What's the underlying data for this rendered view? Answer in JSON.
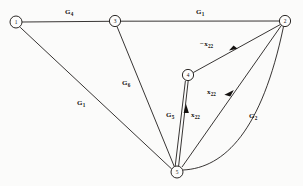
{
  "figure": {
    "kind": "signal-flow-graph",
    "background_color": "#fbfbfa",
    "line_color": "#14110f",
    "width": 303,
    "height": 186
  },
  "nodes": [
    {
      "id": "1",
      "label": "1",
      "x": 16,
      "y": 22,
      "r": 6.0
    },
    {
      "id": "3",
      "label": "3",
      "x": 115,
      "y": 21,
      "r": 5.6
    },
    {
      "id": "2",
      "label": "2",
      "x": 285,
      "y": 21,
      "r": 5.6
    },
    {
      "id": "4",
      "label": "4",
      "x": 188,
      "y": 75,
      "r": 5.6
    },
    {
      "id": "5",
      "label": "5",
      "x": 177,
      "y": 172,
      "r": 6.0
    }
  ],
  "edge_labels": [
    {
      "name": "edge-label-g4",
      "text": "G",
      "sub": "4",
      "x": 65,
      "y": 9,
      "minus": false
    },
    {
      "name": "edge-label-g1-top",
      "text": "G",
      "sub": "1",
      "x": 196,
      "y": 9,
      "minus": false
    },
    {
      "name": "edge-label-minus-x22",
      "text": "x",
      "sub": "22",
      "x": 200,
      "y": 41,
      "minus": true
    },
    {
      "name": "edge-label-g6",
      "text": "G",
      "sub": "6",
      "x": 122,
      "y": 80,
      "minus": false
    },
    {
      "name": "edge-label-g1-left",
      "text": "G",
      "sub": "1",
      "x": 77,
      "y": 100,
      "minus": false
    },
    {
      "name": "edge-label-x22-right",
      "text": "x",
      "sub": "22",
      "x": 207,
      "y": 89,
      "minus": false
    },
    {
      "name": "edge-label-g5",
      "text": "G",
      "sub": "5",
      "x": 166,
      "y": 112,
      "minus": false
    },
    {
      "name": "edge-label-x22-mid",
      "text": "x",
      "sub": "22",
      "x": 191,
      "y": 112,
      "minus": false
    },
    {
      "name": "edge-label-g2",
      "text": "G",
      "sub": "2",
      "x": 249,
      "y": 113,
      "minus": false
    }
  ],
  "edges": [
    {
      "name": "edge-1-to-3",
      "from": "1",
      "to": "3",
      "label": "G4",
      "arrow": false,
      "curved": false
    },
    {
      "name": "edge-3-to-2",
      "from": "3",
      "to": "2",
      "label": "G1",
      "arrow": false,
      "curved": false
    },
    {
      "name": "edge-1-to-5",
      "from": "1",
      "to": "5",
      "label": "G1",
      "arrow": false,
      "curved": false
    },
    {
      "name": "edge-3-to-5",
      "from": "3",
      "to": "5",
      "label": "G6",
      "arrow": false,
      "curved": false
    },
    {
      "name": "edge-4-to-2",
      "from": "4",
      "to": "2",
      "label": "-x22",
      "arrow": true,
      "curved": false
    },
    {
      "name": "edge-5-to-4-g5",
      "from": "5",
      "to": "4",
      "label": "G5",
      "arrow": false,
      "curved": false
    },
    {
      "name": "edge-5-to-4-x22",
      "from": "5",
      "to": "4",
      "label": "x22",
      "arrow": true,
      "curved": false
    },
    {
      "name": "edge-5-to-2-x22",
      "from": "5",
      "to": "2",
      "label": "x22",
      "arrow": true,
      "curved": false
    },
    {
      "name": "edge-5-to-2-g2",
      "from": "5",
      "to": "2",
      "label": "G2",
      "arrow": false,
      "curved": true
    }
  ]
}
